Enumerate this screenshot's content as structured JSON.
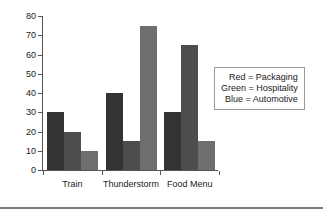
{
  "chart_data": {
    "type": "bar",
    "title": "",
    "xlabel": "",
    "ylabel": "",
    "ylim": [
      0,
      80
    ],
    "yticks": [
      0,
      10,
      20,
      30,
      40,
      50,
      60,
      70,
      80
    ],
    "grid": false,
    "legend_position": "right",
    "categories": [
      "Train",
      "Thunderstorm",
      "Food Menu"
    ],
    "series": [
      {
        "name": "Packaging",
        "color_name": "Red",
        "color": "#333333",
        "values": [
          30,
          40,
          30
        ]
      },
      {
        "name": "Hospitality",
        "color_name": "Green",
        "color": "#4d4d4d",
        "values": [
          20,
          15,
          65
        ]
      },
      {
        "name": "Automotive",
        "color_name": "Blue",
        "color": "#6e6e6e",
        "values": [
          10,
          75,
          15
        ]
      }
    ],
    "legend_entries": [
      "Red = Packaging",
      "Green = Hospitality",
      "Blue = Automotive"
    ]
  },
  "axis": {
    "tick_labels": [
      "0",
      "10",
      "20",
      "30",
      "40",
      "50",
      "60",
      "70",
      "80"
    ],
    "category_labels": [
      "Train",
      "Thunderstorm",
      "Food Menu"
    ]
  },
  "legend": {
    "rows": [
      "Red = Packaging",
      "Green = Hospitality",
      "Blue = Automotive"
    ]
  },
  "colors": {
    "series_1": "#333333",
    "series_2": "#4d4d4d",
    "series_3": "#6e6e6e",
    "axis": "#555555",
    "legend_border": "#9a9a9a",
    "rule": "#7a7a7a",
    "background": "#ffffff"
  }
}
